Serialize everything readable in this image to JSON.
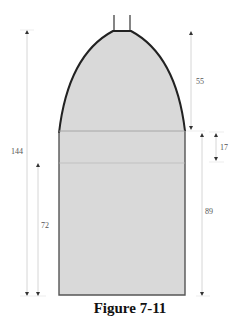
{
  "figure": {
    "caption": "Figure 7-11",
    "colors": {
      "fill": "#d9d9d9",
      "outline": "#333333",
      "dimension_line": "#cccccc",
      "arrow": "#333333"
    }
  },
  "dimensions": {
    "total_height": "144",
    "lower_section": "72",
    "dome_height": "55",
    "band": "17",
    "body_height": "89"
  }
}
